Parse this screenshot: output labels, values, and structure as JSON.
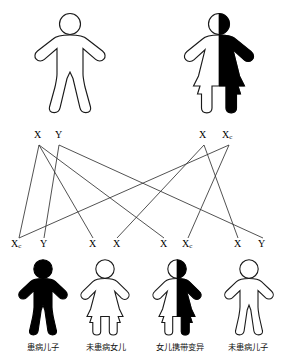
{
  "diagram": {
    "colors": {
      "stroke": "#1a1a1a",
      "fill_affected": "#000000",
      "fill_unaffected": "#ffffff",
      "line": "#333333",
      "background": "#ffffff"
    }
  },
  "parents": [
    {
      "id": "father",
      "figure_type": "male",
      "shading": "unfilled",
      "alleles": [
        {
          "symbol": "X",
          "sub": ""
        },
        {
          "symbol": "Y",
          "sub": ""
        }
      ],
      "genotype_text": "X Y"
    },
    {
      "id": "mother",
      "figure_type": "female",
      "shading": "half-filled",
      "alleles": [
        {
          "symbol": "X",
          "sub": ""
        },
        {
          "symbol": "X",
          "sub": "c"
        }
      ],
      "genotype_text": "X Xc"
    }
  ],
  "children": [
    {
      "id": "child-1",
      "figure_type": "male",
      "shading": "filled",
      "alleles": [
        {
          "symbol": "X",
          "sub": "c"
        },
        {
          "symbol": "Y",
          "sub": ""
        }
      ],
      "genotype_text": "Xc Y",
      "caption": "患病儿子"
    },
    {
      "id": "child-2",
      "figure_type": "female",
      "shading": "unfilled",
      "alleles": [
        {
          "symbol": "X",
          "sub": ""
        },
        {
          "symbol": "X",
          "sub": ""
        }
      ],
      "genotype_text": "X X",
      "caption": "未患病女儿"
    },
    {
      "id": "child-3",
      "figure_type": "female",
      "shading": "half-filled",
      "alleles": [
        {
          "symbol": "X",
          "sub": ""
        },
        {
          "symbol": "X",
          "sub": "c"
        }
      ],
      "genotype_text": "X Xc",
      "caption": "女儿携带变异"
    },
    {
      "id": "child-4",
      "figure_type": "male",
      "shading": "unfilled",
      "alleles": [
        {
          "symbol": "X",
          "sub": ""
        },
        {
          "symbol": "Y",
          "sub": ""
        }
      ],
      "genotype_text": "X Y",
      "caption": "未患病儿子"
    }
  ]
}
